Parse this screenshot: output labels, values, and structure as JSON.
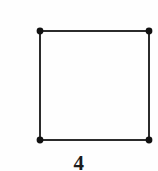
{
  "figure": {
    "caption": "4",
    "background_color": "#fefefe",
    "stroke_color": "#2b2b2b",
    "vertex_color": "#111111",
    "edge_width": 2,
    "vertex_radius": 3.4,
    "shape_name": "square-graph",
    "vertices": [
      {
        "id": "top-left",
        "x": 40,
        "y": 31
      },
      {
        "id": "top-right",
        "x": 149,
        "y": 31
      },
      {
        "id": "bottom-right",
        "x": 149,
        "y": 140
      },
      {
        "id": "bottom-left",
        "x": 40,
        "y": 140
      }
    ],
    "edges": [
      {
        "id": "top-edge",
        "from": "top-left",
        "to": "top-right"
      },
      {
        "id": "right-edge",
        "from": "top-right",
        "to": "bottom-right"
      },
      {
        "id": "bottom-edge",
        "from": "bottom-right",
        "to": "bottom-left"
      },
      {
        "id": "left-edge",
        "from": "bottom-left",
        "to": "top-left"
      }
    ]
  }
}
